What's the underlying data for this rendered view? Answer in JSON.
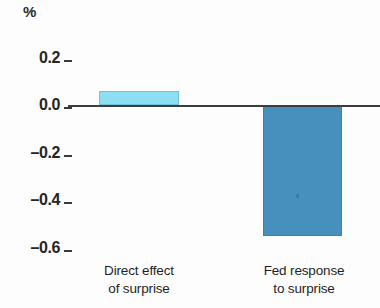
{
  "chart_data": {
    "type": "bar",
    "title": "",
    "subtitle": "",
    "xlabel": "",
    "ylabel": "%",
    "unit": "%",
    "categories": [
      "Direct effect of surprise",
      "Fed response to surprise"
    ],
    "category_lines": [
      {
        "line1": "Direct effect",
        "line2": "of surprise"
      },
      {
        "line1": "Fed response",
        "line2": "to surprise"
      }
    ],
    "values": [
      0.06,
      -0.55
    ],
    "ylim": [
      -0.6,
      0.2
    ],
    "yticks": [
      0.2,
      0.0,
      -0.2,
      -0.4,
      -0.6
    ],
    "ytick_labels": [
      "0.2",
      "0.0",
      "–0.2",
      "–0.4",
      "–0.6"
    ],
    "grid": false,
    "legend": false,
    "legend_position": "none",
    "bar_colors": [
      "#8cdff2",
      "#4590bc"
    ],
    "zero_line_color": "#3d3d3d"
  },
  "axis": {
    "unit_label": "%",
    "ticks": [
      {
        "label": "0.2",
        "value": 0.2
      },
      {
        "label": "0.0",
        "value": 0.0
      },
      {
        "label": "–0.2",
        "value": -0.2
      },
      {
        "label": "–0.4",
        "value": -0.4
      },
      {
        "label": "–0.6",
        "value": -0.6
      }
    ]
  },
  "bars": [
    {
      "name": "direct-effect-of-surprise",
      "line1": "Direct effect",
      "line2": "of surprise",
      "value": 0.06,
      "color": "#8cdff2"
    },
    {
      "name": "fed-response-to-surprise",
      "line1": "Fed response",
      "line2": "to surprise",
      "value": -0.55,
      "color": "#4590bc"
    }
  ]
}
